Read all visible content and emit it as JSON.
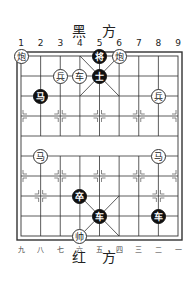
{
  "board": {
    "top_label": "黑 方",
    "bottom_label": "红 方",
    "top_files": [
      "1",
      "2",
      "3",
      "4",
      "5",
      "6",
      "7",
      "8",
      "9"
    ],
    "bottom_files": [
      "九",
      "八",
      "七",
      "六",
      "五",
      "四",
      "三",
      "二",
      "一"
    ]
  },
  "pieces": [
    {
      "char": "炮",
      "side": "white",
      "file": 1,
      "row": 0
    },
    {
      "char": "将",
      "side": "black",
      "file": 5,
      "row": 0
    },
    {
      "char": "炮",
      "side": "white",
      "file": 6,
      "row": 0
    },
    {
      "char": "兵",
      "side": "white",
      "file": 3,
      "row": 1
    },
    {
      "char": "车",
      "side": "white",
      "file": 4,
      "row": 1
    },
    {
      "char": "士",
      "side": "black",
      "file": 5,
      "row": 1
    },
    {
      "char": "马",
      "side": "black",
      "file": 2,
      "row": 2
    },
    {
      "char": "兵",
      "side": "white",
      "file": 8,
      "row": 2
    },
    {
      "char": "马",
      "side": "white",
      "file": 2,
      "row": 5
    },
    {
      "char": "马",
      "side": "white",
      "file": 8,
      "row": 5
    },
    {
      "char": "卒",
      "side": "black",
      "file": 4,
      "row": 7
    },
    {
      "char": "车",
      "side": "black",
      "file": 5,
      "row": 8
    },
    {
      "char": "车",
      "side": "black",
      "file": 8,
      "row": 8
    },
    {
      "char": "帅",
      "side": "white",
      "file": 4,
      "row": 9
    }
  ]
}
